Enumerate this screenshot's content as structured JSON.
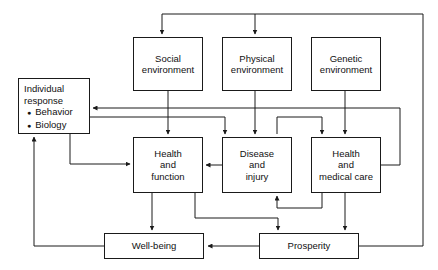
{
  "diagram": {
    "type": "flow-diagram",
    "stroke_color": "#1a1a1a",
    "background_color": "#ffffff",
    "nodes": [
      {
        "id": "individual_response",
        "label_lines": [
          "Individual",
          "response"
        ],
        "bullets": [
          "Behavior",
          "Biology"
        ],
        "x": 18,
        "y": 78,
        "w": 72,
        "h": 56
      },
      {
        "id": "social_environment",
        "label_lines": [
          "Social",
          "environment"
        ],
        "x": 133,
        "y": 37,
        "w": 70,
        "h": 54
      },
      {
        "id": "physical_environment",
        "label_lines": [
          "Physical",
          "environment"
        ],
        "x": 222,
        "y": 37,
        "w": 70,
        "h": 54
      },
      {
        "id": "genetic_environment",
        "label_lines": [
          "Genetic",
          "environment"
        ],
        "x": 311,
        "y": 37,
        "w": 70,
        "h": 54
      },
      {
        "id": "health_and_function",
        "label_lines": [
          "Health",
          "and",
          "function"
        ],
        "x": 133,
        "y": 137,
        "w": 70,
        "h": 56
      },
      {
        "id": "disease_and_injury",
        "label_lines": [
          "Disease",
          "and",
          "injury"
        ],
        "x": 222,
        "y": 137,
        "w": 70,
        "h": 56
      },
      {
        "id": "health_and_medical_care",
        "label_lines": [
          "Health",
          "and",
          "medical care"
        ],
        "x": 311,
        "y": 137,
        "w": 70,
        "h": 56
      },
      {
        "id": "well_being",
        "label_lines": [
          "Well-being"
        ],
        "x": 104,
        "y": 233,
        "w": 100,
        "h": 26
      },
      {
        "id": "prosperity",
        "label_lines": [
          "Prosperity"
        ],
        "x": 259,
        "y": 233,
        "w": 100,
        "h": 26
      }
    ],
    "edges": [
      {
        "from": "prosperity",
        "to": "social_environment",
        "kind": "feedback-top"
      },
      {
        "from": "prosperity",
        "to": "physical_environment",
        "kind": "feedback-top"
      },
      {
        "from": "social_environment",
        "to": "health_and_function",
        "kind": "down"
      },
      {
        "from": "physical_environment",
        "to": "disease_and_injury",
        "kind": "down"
      },
      {
        "from": "genetic_environment",
        "to": "health_and_medical_care",
        "kind": "down"
      },
      {
        "from": "health_and_medical_care",
        "to": "individual_response",
        "kind": "feedback-left"
      },
      {
        "from": "individual_response",
        "to": "disease_and_injury",
        "kind": "right-down"
      },
      {
        "from": "individual_response",
        "to": "health_and_medical_care",
        "kind": "right-down"
      },
      {
        "from": "individual_response",
        "to": "health_and_function",
        "kind": "down-right"
      },
      {
        "from": "disease_and_injury",
        "to": "health_and_function",
        "kind": "left"
      },
      {
        "from": "health_and_medical_care",
        "to": "disease_and_injury",
        "kind": "up-bracket"
      },
      {
        "from": "health_and_function",
        "to": "well_being",
        "kind": "down"
      },
      {
        "from": "health_and_function",
        "to": "prosperity",
        "kind": "down-right"
      },
      {
        "from": "health_and_medical_care",
        "to": "prosperity",
        "kind": "down"
      },
      {
        "from": "prosperity",
        "to": "well_being",
        "kind": "left"
      },
      {
        "from": "well_being",
        "to": "individual_response",
        "kind": "feedback-left-up"
      }
    ]
  }
}
